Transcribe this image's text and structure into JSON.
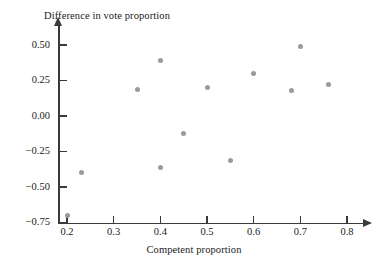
{
  "chart_data": {
    "type": "scatter",
    "title": "",
    "xlabel": "Competent proportion",
    "ylabel": "Difference in vote proportion",
    "xlim": [
      0.155,
      0.815
    ],
    "ylim": [
      -0.79,
      0.6
    ],
    "grid": false,
    "legend": null,
    "xticks": [
      0.2,
      0.3,
      0.4,
      0.5,
      0.6,
      0.7,
      0.8
    ],
    "xtick_labels": [
      "0.2",
      "0.3",
      "0.4",
      "0.5",
      "0.6",
      "0.7",
      "0.8"
    ],
    "yticks": [
      0.5,
      0.25,
      0.0,
      -0.25,
      -0.5,
      -0.75
    ],
    "ytick_labels": [
      "0.50",
      "0.25",
      "0.00",
      "−0.25",
      "−0.50",
      "−0.75"
    ],
    "marker": "filled-circle",
    "marker_color": "#9a9a9c",
    "axis_color": "#3a3a3a",
    "points": [
      {
        "x": 0.2,
        "y": -0.7
      },
      {
        "x": 0.23,
        "y": -0.4
      },
      {
        "x": 0.35,
        "y": 0.19
      },
      {
        "x": 0.4,
        "y": 0.39
      },
      {
        "x": 0.4,
        "y": -0.36
      },
      {
        "x": 0.45,
        "y": -0.12
      },
      {
        "x": 0.5,
        "y": 0.2
      },
      {
        "x": 0.55,
        "y": -0.31
      },
      {
        "x": 0.6,
        "y": 0.3
      },
      {
        "x": 0.68,
        "y": 0.18
      },
      {
        "x": 0.7,
        "y": 0.49
      },
      {
        "x": 0.76,
        "y": 0.22
      }
    ]
  }
}
